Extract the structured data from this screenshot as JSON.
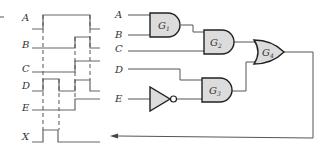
{
  "timing_diagram": {
    "signals": [
      {
        "name": "A",
        "waveform": "low, high (t1..t4), low"
      },
      {
        "name": "B",
        "waveform": "low, high (t3..t4), low"
      },
      {
        "name": "C",
        "waveform": "low, high from t3"
      },
      {
        "name": "D",
        "waveform": "low, high (t1..t2), low (t2..t3), high (t3..t4), low"
      },
      {
        "name": "E",
        "waveform": "low, high from t3"
      },
      {
        "name": "X",
        "waveform": "low, high (t1..t2), low"
      }
    ]
  },
  "circuit": {
    "inputs": [
      "A",
      "B",
      "C",
      "D",
      "E"
    ],
    "gates": [
      {
        "id": "G1",
        "label": "G",
        "sub": "1",
        "type": "AND",
        "inputs": [
          "A",
          "B"
        ]
      },
      {
        "id": "G2",
        "label": "G",
        "sub": "2",
        "type": "AND",
        "inputs": [
          "G1",
          "C"
        ]
      },
      {
        "id": "G3",
        "label": "G",
        "sub": "3",
        "type": "AND",
        "inputs": [
          "D",
          "NOT E"
        ]
      },
      {
        "id": "G4",
        "label": "G",
        "sub": "4",
        "type": "OR",
        "inputs": [
          "G2",
          "G3"
        ]
      }
    ],
    "inverter": {
      "input": "E"
    },
    "output": "X"
  }
}
